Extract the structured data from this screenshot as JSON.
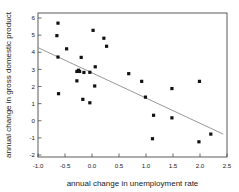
{
  "chart_data": {
    "type": "scatter",
    "title": "",
    "xlabel": "annual change in unemployment rate",
    "ylabel": "annual change in gross domestic product",
    "xlim": [
      -1.0,
      2.5
    ],
    "ylim": [
      -2,
      6
    ],
    "grid": false,
    "legend": null,
    "xticks": [
      "-1.0",
      "-0.5",
      "0.0",
      "0.5",
      "1.0",
      "1.5",
      "2.0",
      "2.5"
    ],
    "xtick_values": [
      -1.0,
      -0.5,
      0.0,
      0.5,
      1.0,
      1.5,
      2.0,
      2.5
    ],
    "yticks": [
      "6",
      "5",
      "4",
      "3",
      "2",
      "1",
      "0",
      "-1",
      "-2"
    ],
    "ytick_values": [
      6,
      5,
      4,
      3,
      2,
      1,
      0,
      -1,
      -2
    ],
    "marker": "filled-square",
    "marker_color": "#111111",
    "points": [
      {
        "x": -0.63,
        "y": 5.7
      },
      {
        "x": -0.65,
        "y": 4.97
      },
      {
        "x": -0.47,
        "y": 4.2
      },
      {
        "x": -0.63,
        "y": 3.72
      },
      {
        "x": -0.2,
        "y": 3.7
      },
      {
        "x": -0.25,
        "y": 2.95
      },
      {
        "x": -0.23,
        "y": 2.88
      },
      {
        "x": -0.28,
        "y": 2.88
      },
      {
        "x": -0.15,
        "y": 2.82
      },
      {
        "x": -0.04,
        "y": 2.83
      },
      {
        "x": -0.28,
        "y": 2.33
      },
      {
        "x": -0.62,
        "y": 1.58
      },
      {
        "x": -0.17,
        "y": 1.25
      },
      {
        "x": -0.04,
        "y": 1.05
      },
      {
        "x": 0.02,
        "y": 5.28
      },
      {
        "x": 0.06,
        "y": 3.15
      },
      {
        "x": 0.05,
        "y": 2.03
      },
      {
        "x": 0.22,
        "y": 4.82
      },
      {
        "x": 0.27,
        "y": 4.35
      },
      {
        "x": 0.68,
        "y": 2.75
      },
      {
        "x": 0.92,
        "y": 2.3
      },
      {
        "x": 0.99,
        "y": 1.38
      },
      {
        "x": 1.14,
        "y": 0.32
      },
      {
        "x": 1.12,
        "y": -1.05
      },
      {
        "x": 1.48,
        "y": 1.88
      },
      {
        "x": 1.48,
        "y": 0.17
      },
      {
        "x": 1.99,
        "y": 2.3
      },
      {
        "x": 1.98,
        "y": -1.23
      },
      {
        "x": 2.2,
        "y": -0.78
      }
    ],
    "fit_line": {
      "type": "linear-regression",
      "x_start": -1.0,
      "y_start": 4.27,
      "x_end": 2.43,
      "y_end": -0.78,
      "color": "#8c8c8c"
    }
  }
}
